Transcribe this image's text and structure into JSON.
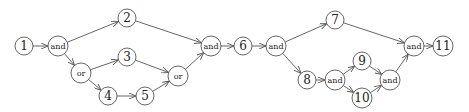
{
  "diagram": {
    "nodes": [
      {
        "id": "n1",
        "label": "1",
        "type": "task",
        "x": 24,
        "y": 46
      },
      {
        "id": "a1",
        "label": "and",
        "type": "gate",
        "x": 58,
        "y": 46
      },
      {
        "id": "o1",
        "label": "or",
        "type": "gate",
        "x": 81,
        "y": 73
      },
      {
        "id": "n2",
        "label": "2",
        "type": "task",
        "x": 127,
        "y": 18
      },
      {
        "id": "n3",
        "label": "3",
        "type": "task",
        "x": 127,
        "y": 57
      },
      {
        "id": "n4",
        "label": "4",
        "type": "task",
        "x": 108,
        "y": 96
      },
      {
        "id": "n5",
        "label": "5",
        "type": "task",
        "x": 145,
        "y": 96
      },
      {
        "id": "o2",
        "label": "or",
        "type": "gate",
        "x": 178,
        "y": 76
      },
      {
        "id": "a2",
        "label": "and",
        "type": "gate",
        "x": 211,
        "y": 46
      },
      {
        "id": "n6",
        "label": "6",
        "type": "task",
        "x": 243,
        "y": 46
      },
      {
        "id": "a3",
        "label": "and",
        "type": "gate",
        "x": 276,
        "y": 46
      },
      {
        "id": "n7",
        "label": "7",
        "type": "task",
        "x": 335,
        "y": 20
      },
      {
        "id": "n8",
        "label": "8",
        "type": "task",
        "x": 307,
        "y": 80
      },
      {
        "id": "a4",
        "label": "and",
        "type": "gate",
        "x": 335,
        "y": 80
      },
      {
        "id": "n9",
        "label": "9",
        "type": "task",
        "x": 362,
        "y": 61
      },
      {
        "id": "n10",
        "label": "10",
        "type": "task",
        "x": 362,
        "y": 98
      },
      {
        "id": "a5",
        "label": "and",
        "type": "gate",
        "x": 390,
        "y": 80
      },
      {
        "id": "a6",
        "label": "and",
        "type": "gate",
        "x": 414,
        "y": 46
      },
      {
        "id": "n11",
        "label": "11",
        "type": "task",
        "x": 443,
        "y": 46
      }
    ],
    "edges": [
      [
        "n1",
        "a1"
      ],
      [
        "a1",
        "n2"
      ],
      [
        "a1",
        "o1"
      ],
      [
        "o1",
        "n3"
      ],
      [
        "o1",
        "n4"
      ],
      [
        "n4",
        "n5"
      ],
      [
        "n3",
        "o2"
      ],
      [
        "n5",
        "o2"
      ],
      [
        "n2",
        "a2"
      ],
      [
        "o2",
        "a2"
      ],
      [
        "a2",
        "n6"
      ],
      [
        "n6",
        "a3"
      ],
      [
        "a3",
        "n7"
      ],
      [
        "a3",
        "n8"
      ],
      [
        "n8",
        "a4"
      ],
      [
        "a4",
        "n9"
      ],
      [
        "a4",
        "n10"
      ],
      [
        "n9",
        "a5"
      ],
      [
        "n10",
        "a5"
      ],
      [
        "n7",
        "a6"
      ],
      [
        "a5",
        "a6"
      ],
      [
        "a6",
        "n11"
      ]
    ]
  }
}
